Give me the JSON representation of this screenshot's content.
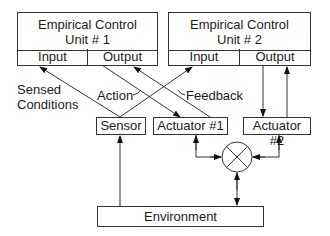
{
  "units": [
    {
      "title_line1": "Empirical Control",
      "title_line2": "Unit # 1",
      "input_label": "Input",
      "output_label": "Output"
    },
    {
      "title_line1": "Empirical Control",
      "title_line2": "Unit # 2",
      "input_label": "Input",
      "output_label": "Output"
    }
  ],
  "components": {
    "sensor": "Sensor",
    "actuator1": "Actuator #1",
    "actuator2": "Actuator #2",
    "environment": "Environment"
  },
  "labels": {
    "sensed_line1": "Sensed",
    "sensed_line2": "Conditions",
    "action": "Action",
    "feedback": "Feedback"
  },
  "junction": {
    "symbol": "summing-junction"
  }
}
